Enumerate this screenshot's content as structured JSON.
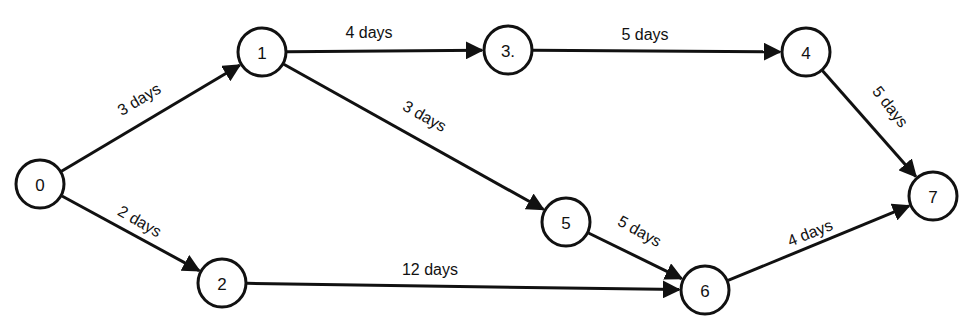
{
  "diagram": {
    "type": "activity-network",
    "nodes": [
      {
        "id": "0",
        "label": "0",
        "x": 40,
        "y": 184
      },
      {
        "id": "1",
        "label": "1",
        "x": 262,
        "y": 52
      },
      {
        "id": "2",
        "label": "2",
        "x": 222,
        "y": 283
      },
      {
        "id": "3",
        "label": "3.",
        "x": 508,
        "y": 50
      },
      {
        "id": "4",
        "label": "4",
        "x": 806,
        "y": 52
      },
      {
        "id": "5",
        "label": "5",
        "x": 566,
        "y": 222
      },
      {
        "id": "6",
        "label": "6",
        "x": 705,
        "y": 290
      },
      {
        "id": "7",
        "label": "7",
        "x": 933,
        "y": 196
      }
    ],
    "edges": [
      {
        "from": "0",
        "to": "1",
        "label": "3 days",
        "lx": 142,
        "ly": 104,
        "angle": -31
      },
      {
        "from": "0",
        "to": "2",
        "label": "2 days",
        "lx": 137,
        "ly": 226,
        "angle": 30
      },
      {
        "from": "1",
        "to": "3",
        "label": "4 days",
        "lx": 369,
        "ly": 38,
        "angle": 0
      },
      {
        "from": "1",
        "to": "5",
        "label": "3 days",
        "lx": 422,
        "ly": 121,
        "angle": 29
      },
      {
        "from": "3",
        "to": "4",
        "label": "5 days",
        "lx": 645,
        "ly": 40,
        "angle": 0
      },
      {
        "from": "4",
        "to": "7",
        "label": "5 days",
        "lx": 886,
        "ly": 110,
        "angle": 52
      },
      {
        "from": "5",
        "to": "6",
        "label": "5 days",
        "lx": 637,
        "ly": 236,
        "angle": 29
      },
      {
        "from": "2",
        "to": "6",
        "label": "12 days",
        "lx": 430,
        "ly": 275,
        "angle": 0
      },
      {
        "from": "6",
        "to": "7",
        "label": "4 days",
        "lx": 812,
        "ly": 238,
        "angle": -22
      }
    ],
    "node_radius": 24,
    "line_color": "#111111",
    "background": "#ffffff"
  }
}
